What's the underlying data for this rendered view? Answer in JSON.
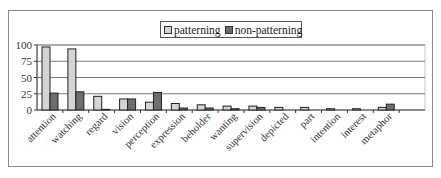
{
  "chart_data": {
    "type": "bar",
    "title": "",
    "xlabel": "",
    "ylabel": "",
    "ylim": [
      0,
      100
    ],
    "yticks": [
      "0",
      "25",
      "50",
      "75",
      "100"
    ],
    "grid": true,
    "legend_position": "top-center",
    "categories": [
      "attention",
      "watching",
      "regard",
      "vision",
      "perception",
      "expression",
      "beholder",
      "wanting",
      "supervision",
      "depicted",
      "part",
      "intention",
      "interest",
      "metaphor"
    ],
    "series": [
      {
        "name": "patterning",
        "color": "#d4d4d4",
        "values": [
          97,
          94,
          21,
          17,
          12,
          10,
          8,
          6,
          6,
          4,
          4,
          2,
          2,
          4
        ]
      },
      {
        "name": "non-patterning",
        "color": "#6e6e6e",
        "values": [
          26,
          28,
          1,
          17,
          27,
          3,
          3,
          2,
          4,
          0,
          0,
          0,
          0,
          9
        ]
      }
    ]
  },
  "legend": {
    "items": [
      {
        "label": "patterning"
      },
      {
        "label": "non-patterning"
      }
    ]
  }
}
